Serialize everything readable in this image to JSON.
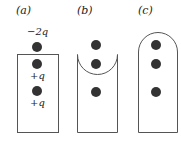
{
  "panels": [
    {
      "label": "(a)",
      "shape": "rectangle",
      "charges": [
        {
          "label": "−2q",
          "position": "outside-top"
        },
        {
          "label": "+q",
          "position": "inside-top"
        },
        {
          "label": "+q",
          "position": "inside-middle"
        }
      ]
    },
    {
      "label": "(b)",
      "shape": "rectangle-with-concave-top",
      "charges": [
        {
          "label": "",
          "position": "outside-top"
        },
        {
          "label": "",
          "position": "inside-top"
        },
        {
          "label": "",
          "position": "inside-middle"
        }
      ]
    },
    {
      "label": "(c)",
      "shape": "rectangle-with-rounded-top",
      "charges": [
        {
          "label": "",
          "position": "inside-top"
        },
        {
          "label": "",
          "position": "inside-upper"
        },
        {
          "label": "",
          "position": "inside-middle"
        }
      ]
    }
  ],
  "colors": {
    "stroke": "#555555",
    "charge": "#333333"
  }
}
